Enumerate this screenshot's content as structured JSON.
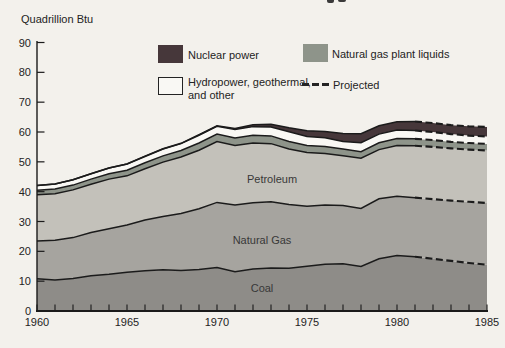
{
  "chart_data": {
    "type": "area",
    "stacked": true,
    "unit_label": "Quadrillion Btu",
    "grid": false,
    "legend_position": "top-inside",
    "ylim": [
      0,
      90
    ],
    "y_ticks": [
      90,
      80,
      70,
      60,
      50,
      40,
      30,
      20,
      10,
      0
    ],
    "x_tick_years": [
      1960,
      1965,
      1970,
      1975,
      1980,
      1985
    ],
    "projected_from_year": 1981,
    "line_color": "#1b1b1b",
    "x": [
      1960,
      1961,
      1962,
      1963,
      1964,
      1965,
      1966,
      1967,
      1968,
      1969,
      1970,
      1971,
      1972,
      1973,
      1974,
      1975,
      1976,
      1977,
      1978,
      1979,
      1980,
      1981,
      1982,
      1983,
      1984,
      1985
    ],
    "series": [
      {
        "name": "Coal",
        "color": "#8e8c88",
        "values": [
          10.8,
          10.4,
          10.9,
          11.8,
          12.3,
          13.0,
          13.5,
          13.8,
          13.6,
          13.9,
          14.6,
          13.2,
          14.1,
          14.4,
          14.3,
          15.0,
          15.7,
          15.8,
          14.9,
          17.5,
          18.6,
          18.2,
          17.5,
          16.8,
          16.1,
          15.5
        ]
      },
      {
        "name": "Natural Gas",
        "color": "#a6a49f",
        "values": [
          12.7,
          13.3,
          13.7,
          14.5,
          15.3,
          15.8,
          17.0,
          17.9,
          19.1,
          20.4,
          21.8,
          22.3,
          22.2,
          22.2,
          21.4,
          20.1,
          19.8,
          19.6,
          19.5,
          20.1,
          19.9,
          19.8,
          20.0,
          20.2,
          20.5,
          20.7
        ]
      },
      {
        "name": "Petroleum",
        "color": "#c3c1ba",
        "values": [
          15.5,
          15.6,
          16.0,
          16.2,
          16.6,
          16.5,
          17.2,
          18.2,
          18.9,
          19.6,
          20.4,
          20.0,
          20.0,
          19.5,
          18.6,
          18.0,
          17.3,
          16.6,
          16.8,
          16.5,
          17.0,
          17.4,
          17.5,
          17.5,
          17.5,
          17.6
        ]
      },
      {
        "name": "Natural gas plant liquids",
        "color": "#8e948a",
        "values": [
          1.5,
          1.6,
          1.6,
          1.7,
          1.8,
          1.9,
          2.0,
          2.1,
          2.2,
          2.4,
          2.5,
          2.5,
          2.6,
          2.6,
          2.5,
          2.4,
          2.3,
          2.3,
          2.2,
          2.3,
          2.3,
          2.3,
          2.3,
          2.2,
          2.2,
          2.2
        ]
      },
      {
        "name": "Hydropower, geothermal, and other",
        "color": "#f9f8f4",
        "values": [
          1.6,
          1.7,
          1.8,
          1.8,
          1.9,
          2.1,
          2.1,
          2.3,
          2.3,
          2.6,
          2.6,
          2.8,
          2.9,
          3.0,
          3.3,
          3.0,
          3.0,
          2.5,
          3.0,
          2.9,
          2.9,
          2.8,
          2.7,
          2.6,
          2.5,
          2.5
        ]
      },
      {
        "name": "Nuclear power",
        "color": "#46373a",
        "values": [
          0,
          0,
          0,
          0,
          0,
          0,
          0.1,
          0.1,
          0.1,
          0.2,
          0.2,
          0.4,
          0.6,
          0.9,
          1.3,
          1.9,
          2.1,
          2.7,
          3.0,
          2.8,
          2.7,
          3.0,
          3.0,
          3.0,
          3.1,
          3.2
        ]
      }
    ],
    "area_labels": [
      {
        "text": "Petroleum"
      },
      {
        "text": "Natural Gas"
      },
      {
        "text": "Coal"
      }
    ]
  },
  "legend": {
    "items": [
      {
        "label": "Nuclear power",
        "swatch_color": "#46373a"
      },
      {
        "label": "Natural gas plant liquids",
        "swatch_color": "#8e948a"
      },
      {
        "label_line1": "Hydropower, geothermal,",
        "label_line2": "and other",
        "swatch_color": "#f9f8f4"
      },
      {
        "label": "Projected",
        "style": "dashed-line"
      }
    ]
  }
}
